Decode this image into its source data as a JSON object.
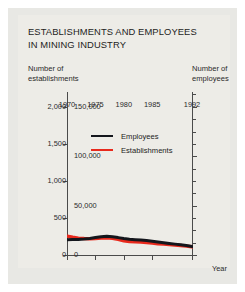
{
  "title": "ESTABLISHMENTS AND EMPLOYEES\nIN MINING INDUSTRY",
  "axis_header_left": "Number of\nestablishments",
  "axis_header_right": "Number of\nemployees",
  "year_caption": "Year",
  "legend": [
    {
      "label": "Employees",
      "color": "#14161c",
      "series": "employees"
    },
    {
      "label": "Establishments",
      "color": "#e8291c",
      "series": "establishments"
    }
  ],
  "colors": {
    "employees": "#14161c",
    "establishments": "#e8291c",
    "axis": "#4b4b4b",
    "background": "#edece7",
    "figure_background": "#e8e8e4",
    "text": "#1d1d1d"
  },
  "chart_data": {
    "type": "line",
    "title": "ESTABLISHMENTS AND EMPLOYEES IN MINING INDUSTRY",
    "xlabel": "Year",
    "ylabel": "Number of establishments",
    "y2label": "Number of employees",
    "grid": false,
    "legend_position": "inside-upper-center",
    "xlim": [
      1970,
      1992
    ],
    "ylim": [
      0,
      2200
    ],
    "y2lim": [
      0,
      165000
    ],
    "xticks": [
      1970,
      1975,
      1980,
      1985,
      1992
    ],
    "xtick_labels": [
      "1970",
      "1975",
      "1980",
      "1985",
      "1992"
    ],
    "yticks": [
      0,
      500,
      1000,
      1500,
      2000
    ],
    "ytick_labels": [
      "0",
      "500",
      "1,000",
      "1,500",
      "2,000"
    ],
    "y2ticks": [
      0,
      50000,
      100000,
      150000
    ],
    "y2tick_labels": [
      "0",
      "50,000",
      "100,000",
      "150,000"
    ],
    "y2minor_ticks": [
      12500,
      25000,
      37500,
      62500,
      75000,
      87500,
      112500,
      125000,
      137500,
      162500
    ],
    "x": [
      1970,
      1971,
      1972,
      1973,
      1974,
      1975,
      1976,
      1977,
      1978,
      1979,
      1980,
      1981,
      1982,
      1983,
      1984,
      1985,
      1986,
      1987,
      1988,
      1989,
      1990,
      1991,
      1992
    ],
    "series": [
      {
        "name": "Employees",
        "axis": "right",
        "color": "#14161c",
        "units": "employees",
        "values": [
          15500,
          15600,
          15800,
          16200,
          16800,
          17600,
          18500,
          18900,
          18400,
          17600,
          16600,
          15900,
          15500,
          15100,
          14600,
          14000,
          13100,
          12300,
          11600,
          11000,
          10400,
          9600,
          8700
        ]
      },
      {
        "name": "Establishments",
        "axis": "left",
        "color": "#e8291c",
        "units": "establishments",
        "values": [
          255,
          240,
          228,
          222,
          220,
          222,
          228,
          232,
          226,
          210,
          192,
          182,
          178,
          174,
          168,
          162,
          152,
          146,
          140,
          134,
          128,
          120,
          112
        ]
      }
    ]
  }
}
